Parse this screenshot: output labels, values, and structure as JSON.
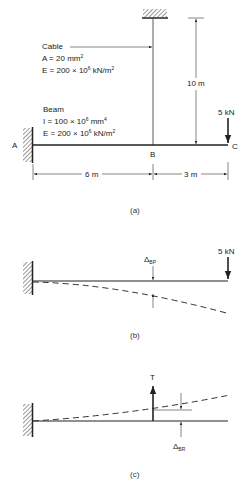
{
  "figure_a": {
    "cable_label": "Cable",
    "cable_area": "A = 20 mm",
    "cable_area_exp": "2",
    "cable_E": "E = 200 × 10",
    "cable_E_exp": "6",
    "cable_E_unit": " kN/m",
    "cable_E_unit_exp": "2",
    "beam_label": "Beam",
    "beam_I": "I = 100 × 10",
    "beam_I_exp": "6",
    "beam_I_unit": " mm",
    "beam_I_unit_exp": "4",
    "beam_E": "E = 200 × 10",
    "beam_E_exp": "6",
    "beam_E_unit": " kN/m",
    "beam_E_unit_exp": "2",
    "point_A": "A",
    "point_B": "B",
    "point_C": "C",
    "load": "5 kN",
    "cable_length": "10 m",
    "span_AB": "6 m",
    "span_BC": "3 m",
    "caption": "(a)"
  },
  "figure_b": {
    "delta": "Δ",
    "delta_sub": "BP",
    "load": "5 kN",
    "caption": "(b)"
  },
  "figure_c": {
    "tension": "T",
    "delta": "Δ",
    "delta_sub": "BR",
    "caption": "(c)"
  }
}
